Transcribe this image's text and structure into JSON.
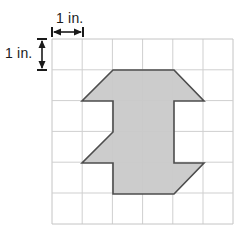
{
  "figure": {
    "labels": {
      "horizontal_dimension": "1 in.",
      "vertical_dimension": "1 in."
    },
    "grid": {
      "columns": 6,
      "rows": 6,
      "cell_size_px": 30.2,
      "origin_x_px": 52,
      "origin_y_px": 39,
      "width_px": 181,
      "height_px": 185,
      "line_color": "#cfcfcf",
      "border_color": "#c4c4c4",
      "unit_label": "1 in."
    },
    "shape": {
      "name": "i-beam-polygon",
      "fill_color": "#c9c9c9",
      "stroke_color": "#4d4d4d",
      "stroke_width_px": 1.6,
      "points": "113,70 174,70 204,101 174,101 174,163 204,163 174,194 113,194 113,163 82,163 113,132 113,101 82,101",
      "vertices": [
        {
          "x": 113,
          "y": 70
        },
        {
          "x": 174,
          "y": 70
        },
        {
          "x": 204,
          "y": 101
        },
        {
          "x": 174,
          "y": 101
        },
        {
          "x": 174,
          "y": 163
        },
        {
          "x": 204,
          "y": 163
        },
        {
          "x": 174,
          "y": 194
        },
        {
          "x": 113,
          "y": 194
        },
        {
          "x": 113,
          "y": 163
        },
        {
          "x": 82,
          "y": 163
        },
        {
          "x": 82,
          "y": 101
        },
        {
          "x": 113,
          "y": 101
        }
      ]
    },
    "dimension_arrows": {
      "horizontal": {
        "x1": 52,
        "x2": 83,
        "y": 32,
        "color": "#1a1a1a"
      },
      "vertical": {
        "y1": 39,
        "y2": 70,
        "x": 42,
        "color": "#1a1a1a"
      }
    }
  }
}
